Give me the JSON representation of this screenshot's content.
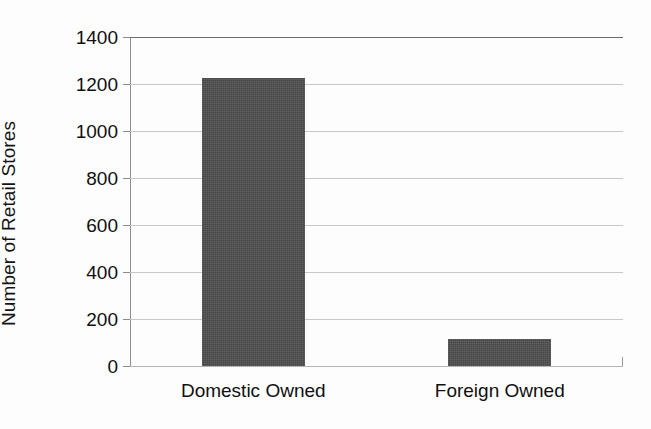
{
  "chart_data": {
    "type": "bar",
    "title": "",
    "subtitle": "",
    "xlabel": "",
    "ylabel": "Number of Retail Stores",
    "categories": [
      "Domestic Owned",
      "Foreign Owned"
    ],
    "values": [
      1225,
      115
    ],
    "series": [
      {
        "name": "Number of Retail Stores",
        "values": [
          1225,
          115
        ]
      }
    ],
    "ylim": [
      0,
      1400
    ],
    "ytick_labels": [
      "0",
      "200",
      "400",
      "600",
      "800",
      "1000",
      "1200",
      "1400"
    ],
    "ytick_values": [
      0,
      200,
      400,
      600,
      800,
      1000,
      1200,
      1400
    ],
    "ytick_interval": 200,
    "grid": true,
    "grid_axis": "y",
    "legend": false,
    "legend_position": "none",
    "bar_color": "#4d4d4d",
    "grid_color": "#c8c8c8",
    "axis_color": "#8d8d8d",
    "background_color": "#fdfdfd",
    "text_color": "#101010",
    "annotations": []
  }
}
